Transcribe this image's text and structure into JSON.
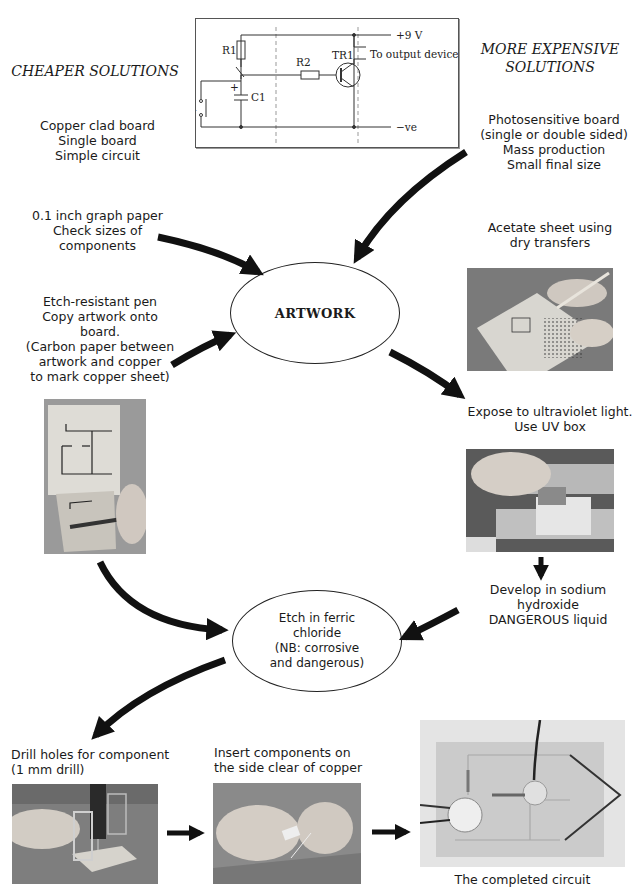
{
  "schematic": {
    "labels": {
      "supply": "+9 V",
      "output": "To output device",
      "ground": "−ve",
      "r1": "R1",
      "r2": "R2",
      "tr1": "TR1",
      "s1": "S1",
      "c1": "C1",
      "plus": "+"
    }
  },
  "left_heading": "CHEAPER SOLUTIONS",
  "right_heading": "MORE EXPENSIVE\nSOLUTIONS",
  "left_notes": {
    "board": "Copper clad board\nSingle board\nSimple circuit",
    "graph_paper": "0.1 inch graph paper\nCheck sizes of\ncomponents",
    "etch_pen": "Etch-resistant pen\nCopy artwork onto\nboard.\n(Carbon paper between\nartwork and copper\nto mark copper sheet)"
  },
  "right_notes": {
    "board": "Photosensitive board\n(single or double sided)\nMass production\nSmall final size",
    "acetate": "Acetate sheet using\ndry transfers",
    "expose": "Expose to ultraviolet light.\nUse UV box",
    "develop": "Develop in sodium hydroxide\nDANGEROUS liquid"
  },
  "nodes": {
    "artwork": "ARTWORK",
    "etch": "Etch in ferric\nchloride\n(NB: corrosive\nand dangerous)"
  },
  "bottom_steps": {
    "drill": "Drill holes for component\n(1 mm drill)",
    "insert": "Insert components on\nthe side clear of copper",
    "completed": "The completed circuit"
  },
  "photos": {
    "acetate": "photo-acetate-dry-transfers",
    "etch_pen": "photo-etch-resistant-pen",
    "uv_box": "photo-uv-box",
    "drill": "photo-drilling",
    "insert": "photo-inserting-components",
    "completed": "photo-completed-circuit"
  },
  "colors": {
    "ink": "#111111",
    "photo_gray": "#8f8f8f",
    "paper": "#ffffff"
  }
}
